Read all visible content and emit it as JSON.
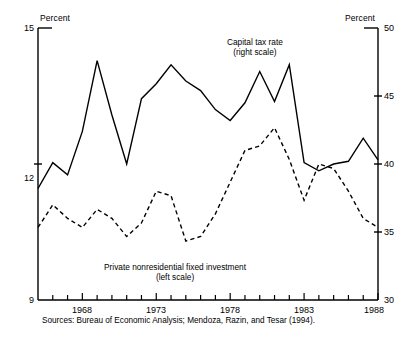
{
  "axis_unit_left": "Percent",
  "axis_unit_right": "Percent",
  "left_ticks": [
    "15",
    "12",
    "9"
  ],
  "right_ticks": [
    "50",
    "45",
    "40",
    "35",
    "30"
  ],
  "x_tick_labels": [
    "1968",
    "1973",
    "1978",
    "1983",
    "1988"
  ],
  "series_labels": {
    "tax_line1": "Capital tax rate",
    "tax_line2": "(right scale)",
    "inv_line1": "Private nonresidential fixed investment",
    "inv_line2": "(left scale)"
  },
  "sources": "Sources: Bureau of Economic Analysis; Mendoza, Razin, and Tesar (1994).",
  "colors": {
    "ink": "#000000",
    "background": "#ffffff"
  },
  "chart_data": {
    "type": "line",
    "title": "",
    "subtitle": "",
    "xlabel": "",
    "ylabel": "Percent",
    "y2label": "Percent",
    "xlim": [
      1965,
      1988
    ],
    "ylim": [
      9,
      15
    ],
    "y2lim": [
      30,
      50
    ],
    "ytick_values": [
      9,
      12,
      15
    ],
    "y2tick_values": [
      30,
      35,
      40,
      45,
      50
    ],
    "xtick_values": [
      1968,
      1973,
      1978,
      1983,
      1988
    ],
    "xtick_minor_every": 1,
    "grid": false,
    "legend_position": "inline-annotation",
    "x": [
      1965,
      1966,
      1967,
      1968,
      1969,
      1970,
      1971,
      1972,
      1973,
      1974,
      1975,
      1976,
      1977,
      1978,
      1979,
      1980,
      1981,
      1982,
      1983,
      1984,
      1985,
      1986,
      1987,
      1988
    ],
    "series": [
      {
        "name": "Capital tax rate",
        "axis": "right",
        "style": "solid",
        "units": "percent",
        "values": [
          38.2,
          40.1,
          39.2,
          42.4,
          47.6,
          43.6,
          40.0,
          44.8,
          45.9,
          47.3,
          46.1,
          45.4,
          44.0,
          43.2,
          44.5,
          46.8,
          44.6,
          47.3,
          40.1,
          39.5,
          40.0,
          40.2,
          41.9,
          40.3
        ]
      },
      {
        "name": "Private nonresidential fixed investment",
        "axis": "left",
        "style": "dashed",
        "units": "percent",
        "values": [
          10.6,
          11.1,
          10.8,
          10.6,
          11.0,
          10.8,
          10.4,
          10.7,
          11.4,
          11.3,
          10.3,
          10.4,
          10.9,
          11.6,
          12.3,
          12.4,
          12.8,
          12.1,
          11.2,
          12.0,
          11.9,
          11.4,
          10.8,
          10.6
        ]
      }
    ],
    "annotations": [
      {
        "text": "Capital tax rate (right scale)",
        "points_to": "solid line"
      },
      {
        "text": "Private nonresidential fixed investment (left scale)",
        "points_to": "dashed line"
      }
    ]
  }
}
